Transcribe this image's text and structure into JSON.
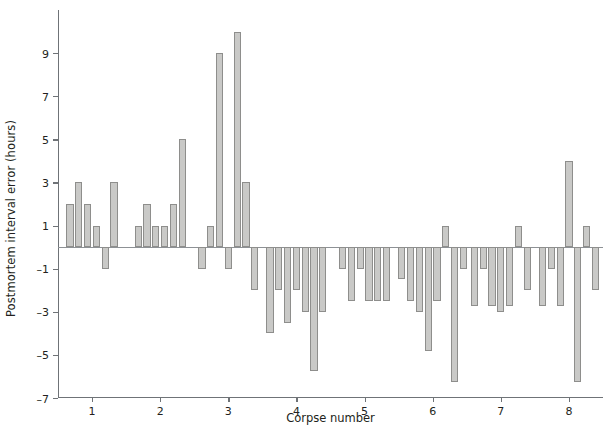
{
  "chart_data": {
    "type": "bar",
    "title": "",
    "xlabel": "Corpse number",
    "ylabel": "Postmortem interval error (hours)",
    "ylim": [
      -7,
      11
    ],
    "yticks": [
      -7,
      -5,
      -3,
      -1,
      1,
      3,
      5,
      7,
      9
    ],
    "ytick_labels": [
      "-7",
      "-5",
      "-3",
      "-1",
      "1",
      "3",
      "5",
      "7",
      "9"
    ],
    "xticks": [
      1,
      2,
      3,
      4,
      5,
      6,
      7,
      8
    ],
    "xtick_labels": [
      "1",
      "2",
      "3",
      "4",
      "5",
      "6",
      "7",
      "8"
    ],
    "grid": false,
    "legend": null,
    "bar_color": "#c9c9c7",
    "bar_edge_color": "#8e8e8c",
    "axis_color": "#6f7377",
    "zero_line": 0,
    "categories": [
      "1",
      "2",
      "3",
      "4",
      "5",
      "6",
      "7",
      "8"
    ],
    "groups": [
      {
        "corpse": "1",
        "values": [
          2,
          3,
          2,
          1,
          -1,
          3
        ]
      },
      {
        "corpse": "2",
        "values": [
          1,
          2,
          1,
          1,
          2,
          5
        ]
      },
      {
        "corpse": "3",
        "values": [
          -1,
          1,
          9,
          -1,
          10,
          3,
          -2
        ]
      },
      {
        "corpse": "4",
        "values": [
          -4,
          -2,
          -3.5,
          -2,
          -3,
          -5.75,
          -3
        ]
      },
      {
        "corpse": "5",
        "values": [
          -1,
          -2.5,
          -1,
          -2.5,
          -2.5,
          -2.5
        ]
      },
      {
        "corpse": "6",
        "values": [
          -1.5,
          -2.5,
          -3,
          -4.8,
          -2.5,
          1,
          -6.25,
          -1
        ]
      },
      {
        "corpse": "7",
        "values": [
          -2.75,
          -1,
          -2.75,
          -3,
          -2.75,
          1,
          -2
        ]
      },
      {
        "corpse": "8",
        "values": [
          -2.75,
          -1,
          -2.75,
          4,
          -6.25,
          1,
          -2
        ]
      }
    ],
    "values_flat": [
      2,
      3,
      2,
      1,
      -1,
      3,
      1,
      2,
      1,
      1,
      2,
      5,
      -1,
      1,
      9,
      -1,
      10,
      3,
      -2,
      -4,
      -2,
      -3.5,
      -2,
      -3,
      -5.75,
      -3,
      -1,
      -2.5,
      -1,
      -2.5,
      -2.5,
      -2.5,
      -1.5,
      -2.5,
      -3,
      -4.8,
      -2.5,
      1,
      -6.25,
      -1,
      -2.75,
      -1,
      -2.75,
      -3,
      -2.75,
      1,
      -2,
      -2.75,
      -1,
      -2.75,
      4,
      -6.25,
      1,
      -2
    ]
  }
}
